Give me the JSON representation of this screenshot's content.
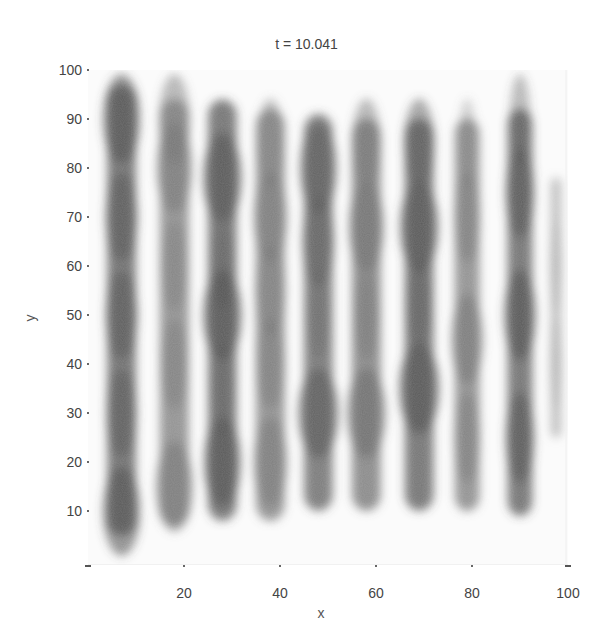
{
  "chart_data": {
    "type": "heatmap",
    "title": "t = 10.041",
    "xlabel": "x",
    "ylabel": "y",
    "xlim": [
      0,
      100
    ],
    "ylim": [
      0,
      100
    ],
    "xticks": [
      20,
      40,
      60,
      80,
      100
    ],
    "yticks": [
      10,
      20,
      30,
      40,
      50,
      60,
      70,
      80,
      90,
      100
    ],
    "grid": false,
    "colormap": "grayscale (white = low, dark gray = high)",
    "stripes": [
      {
        "x_center": 7,
        "y_range": [
          5,
          97
        ],
        "width": 7,
        "darkness": 0.85,
        "profile": [
          [
            10,
            1.1
          ],
          [
            30,
            0.9
          ],
          [
            50,
            0.95
          ],
          [
            70,
            0.95
          ],
          [
            90,
            1.1
          ]
        ]
      },
      {
        "x_center": 18,
        "y_range": [
          7,
          94
        ],
        "width": 7,
        "darkness": 0.65,
        "profile": [
          [
            15,
            1.1
          ],
          [
            40,
            0.8
          ],
          [
            60,
            0.75
          ],
          [
            80,
            1.05
          ],
          [
            90,
            0.9
          ]
        ]
      },
      {
        "x_center": 28,
        "y_range": [
          8,
          94
        ],
        "width": 7,
        "darkness": 0.85,
        "profile": [
          [
            20,
            1.1
          ],
          [
            35,
            0.6
          ],
          [
            50,
            1.15
          ],
          [
            60,
            0.6
          ],
          [
            78,
            1.15
          ]
        ]
      },
      {
        "x_center": 38,
        "y_range": [
          8,
          92
        ],
        "width": 7,
        "darkness": 0.65,
        "profile": [
          [
            20,
            1.0
          ],
          [
            40,
            0.85
          ],
          [
            55,
            0.9
          ],
          [
            70,
            1.0
          ],
          [
            85,
            0.8
          ]
        ]
      },
      {
        "x_center": 48,
        "y_range": [
          10,
          91
        ],
        "width": 7,
        "darkness": 0.8,
        "profile": [
          [
            30,
            1.2
          ],
          [
            50,
            0.6
          ],
          [
            65,
            0.95
          ],
          [
            80,
            1.1
          ]
        ]
      },
      {
        "x_center": 58,
        "y_range": [
          10,
          90
        ],
        "width": 7,
        "darkness": 0.7,
        "profile": [
          [
            30,
            1.15
          ],
          [
            50,
            0.7
          ],
          [
            68,
            1.05
          ],
          [
            85,
            0.85
          ]
        ]
      },
      {
        "x_center": 69,
        "y_range": [
          10,
          90
        ],
        "width": 7,
        "darkness": 0.85,
        "profile": [
          [
            35,
            1.2
          ],
          [
            52,
            0.7
          ],
          [
            68,
            1.15
          ],
          [
            85,
            0.9
          ]
        ]
      },
      {
        "x_center": 79,
        "y_range": [
          10,
          90
        ],
        "width": 6,
        "darkness": 0.65,
        "profile": [
          [
            25,
            0.9
          ],
          [
            45,
            1.1
          ],
          [
            70,
            0.9
          ],
          [
            85,
            0.6
          ]
        ]
      },
      {
        "x_center": 90,
        "y_range": [
          9,
          92
        ],
        "width": 6,
        "darkness": 0.85,
        "profile": [
          [
            25,
            1.0
          ],
          [
            50,
            1.1
          ],
          [
            75,
            1.0
          ],
          [
            90,
            0.7
          ]
        ]
      },
      {
        "x_center": 97.5,
        "y_range": [
          25,
          78
        ],
        "width": 2.5,
        "darkness": 0.35,
        "profile": [
          [
            40,
            1.0
          ],
          [
            60,
            1.0
          ]
        ]
      }
    ]
  }
}
